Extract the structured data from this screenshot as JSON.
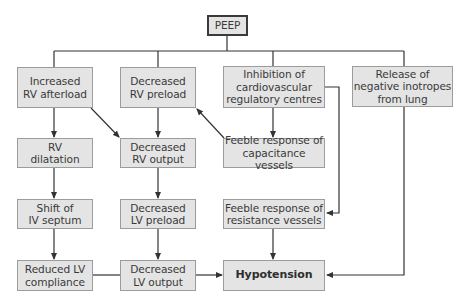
{
  "diagram": {
    "type": "flowchart",
    "title": "PEEP",
    "nodes": {
      "peep": {
        "label": "PEEP"
      },
      "increased_rv_afterload": {
        "label": "Increased\nRV afterload"
      },
      "decreased_rv_preload": {
        "label": "Decreased\nRV preload"
      },
      "inhibition_cv_centres": {
        "label": "Inhibition of\ncardiovascular\nregulatory centres"
      },
      "release_negative_inotropes": {
        "label": "Release of\nnegative inotropes\nfrom lung"
      },
      "rv_dilatation": {
        "label": "RV\ndilatation"
      },
      "decreased_rv_output": {
        "label": "Decreased\nRV output"
      },
      "feeble_capacitance": {
        "label": "Feeble response of\ncapacitance vessels"
      },
      "shift_iv_septum": {
        "label": "Shift of\nIV septum"
      },
      "decreased_lv_preload": {
        "label": "Decreased\nLV preload"
      },
      "feeble_resistance": {
        "label": "Feeble response of\nresistance vessels"
      },
      "reduced_lv_compliance": {
        "label": "Reduced LV\ncompliance"
      },
      "decreased_lv_output": {
        "label": "Decreased\nLV output"
      },
      "hypotension": {
        "label": "Hypotension"
      }
    },
    "edges": [
      {
        "from": "PEEP",
        "to": "Increased RV afterload"
      },
      {
        "from": "PEEP",
        "to": "Decreased RV preload"
      },
      {
        "from": "PEEP",
        "to": "Inhibition of cardiovascular regulatory centres"
      },
      {
        "from": "PEEP",
        "to": "Release of negative inotropes from lung"
      },
      {
        "from": "Increased RV afterload",
        "to": "RV dilatation"
      },
      {
        "from": "Increased RV afterload",
        "to": "Decreased RV output"
      },
      {
        "from": "Decreased RV preload",
        "to": "Decreased RV output"
      },
      {
        "from": "Feeble response of capacitance vessels",
        "to": "Decreased RV preload"
      },
      {
        "from": "Inhibition of cardiovascular regulatory centres",
        "to": "Feeble response of capacitance vessels"
      },
      {
        "from": "Inhibition of cardiovascular regulatory centres",
        "to": "Feeble response of resistance vessels"
      },
      {
        "from": "RV dilatation",
        "to": "Shift of IV septum"
      },
      {
        "from": "Decreased RV output",
        "to": "Decreased LV preload"
      },
      {
        "from": "Shift of IV septum",
        "to": "Reduced LV compliance"
      },
      {
        "from": "Decreased LV preload",
        "to": "Decreased LV output"
      },
      {
        "from": "Reduced LV compliance",
        "to": "Decreased LV output"
      },
      {
        "from": "Decreased LV output",
        "to": "Hypotension"
      },
      {
        "from": "Feeble response of resistance vessels",
        "to": "Hypotension"
      },
      {
        "from": "Release of negative inotropes from lung",
        "to": "Hypotension"
      }
    ],
    "colors": {
      "node_fill": "#e4e4e4",
      "node_border": "#9c9c9c",
      "root_border": "#3a3a3a",
      "line": "#333333",
      "text": "#3a3a3a"
    }
  }
}
